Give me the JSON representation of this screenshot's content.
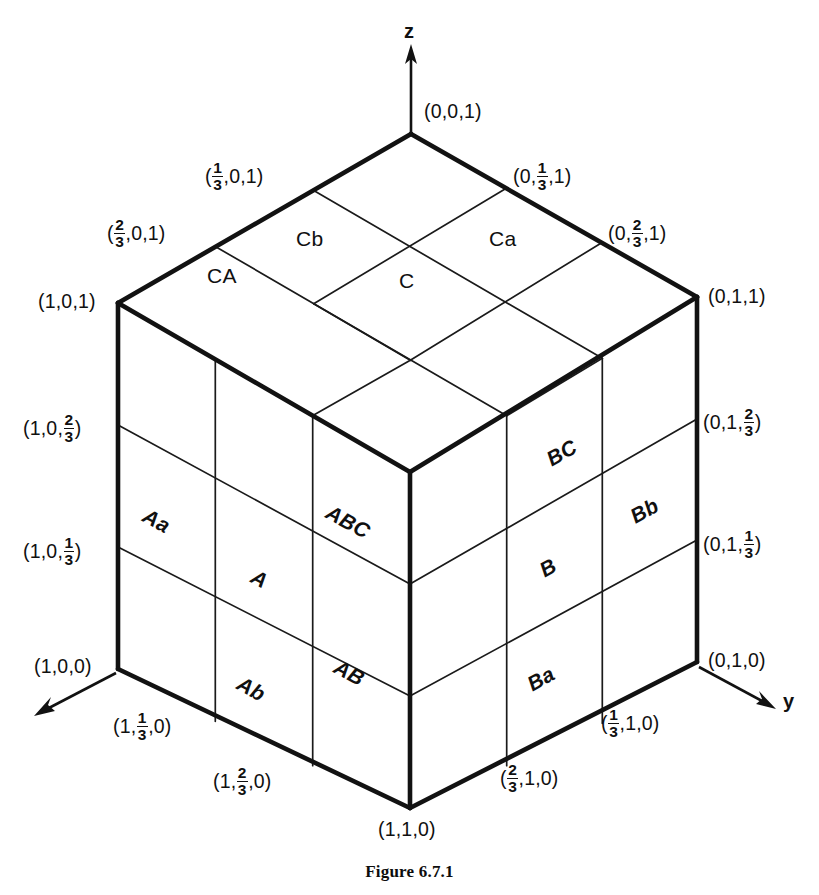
{
  "figure": {
    "caption": "Figure 6.7.1",
    "axes": [
      {
        "name": "z-axis",
        "letter": "z"
      },
      {
        "name": "y-axis",
        "letter": "y"
      },
      {
        "name": "x-axis",
        "letter": ""
      }
    ]
  },
  "coords": {
    "top_vertex": {
      "text": "(0,0,1)",
      "parts": [
        "(0,0,1)"
      ]
    },
    "top_left_third": {
      "prefix": "(",
      "num": "1",
      "den": "3",
      "suffix": ",0,1)"
    },
    "top_right_third": {
      "prefix": "(0,",
      "num": "1",
      "den": "3",
      "suffix": ",1)"
    },
    "top_left_twothird": {
      "prefix": "(",
      "num": "2",
      "den": "3",
      "suffix": ",0,1)"
    },
    "top_right_twothird": {
      "prefix": "(0,",
      "num": "2",
      "den": "3",
      "suffix": ",1)"
    },
    "left_top": {
      "text": "(1,0,1)"
    },
    "right_top": {
      "text": "(0,1,1)"
    },
    "left_two_third": {
      "prefix": "(1,0,",
      "num": "2",
      "den": "3",
      "suffix": ")"
    },
    "right_two_third": {
      "prefix": "(0,1,",
      "num": "2",
      "den": "3",
      "suffix": ")"
    },
    "left_one_third": {
      "prefix": "(1,0,",
      "num": "1",
      "den": "3",
      "suffix": ")"
    },
    "right_one_third": {
      "prefix": "(0,1,",
      "num": "1",
      "den": "3",
      "suffix": ")"
    },
    "left_bottom": {
      "text": "(1,0,0)"
    },
    "right_bottom": {
      "text": "(0,1,0)"
    },
    "bottom_left_third": {
      "prefix": "(1,",
      "num": "1",
      "den": "3",
      "suffix": ",0)"
    },
    "bottom_left_twothird": {
      "prefix": "(1,",
      "num": "2",
      "den": "3",
      "suffix": ",0)"
    },
    "bottom_right_third": {
      "prefix": "(",
      "num": "1",
      "den": "3",
      "suffix": ",1,0)"
    },
    "bottom_right_twothird": {
      "prefix": "(",
      "num": "2",
      "den": "3",
      "suffix": ",1,0)"
    },
    "bottom_vertex": {
      "text": "(1,1,0)"
    }
  },
  "regions": {
    "top_face": [
      {
        "id": "CA",
        "label": "CA"
      },
      {
        "id": "Cb",
        "label": "Cb"
      },
      {
        "id": "C",
        "label": "C"
      },
      {
        "id": "Ca",
        "label": "Ca"
      }
    ],
    "left_face": [
      {
        "id": "Aa",
        "label": "Aa"
      },
      {
        "id": "A",
        "label": "A"
      },
      {
        "id": "Ab",
        "label": "Ab"
      },
      {
        "id": "ABC",
        "label": "ABC"
      },
      {
        "id": "AB",
        "label": "AB"
      }
    ],
    "right_face": [
      {
        "id": "BC",
        "label": "BC"
      },
      {
        "id": "Bb",
        "label": "Bb"
      },
      {
        "id": "B",
        "label": "B"
      },
      {
        "id": "Ba",
        "label": "Ba"
      }
    ]
  },
  "colors": {
    "ink": "#101010",
    "background": "#ffffff"
  }
}
